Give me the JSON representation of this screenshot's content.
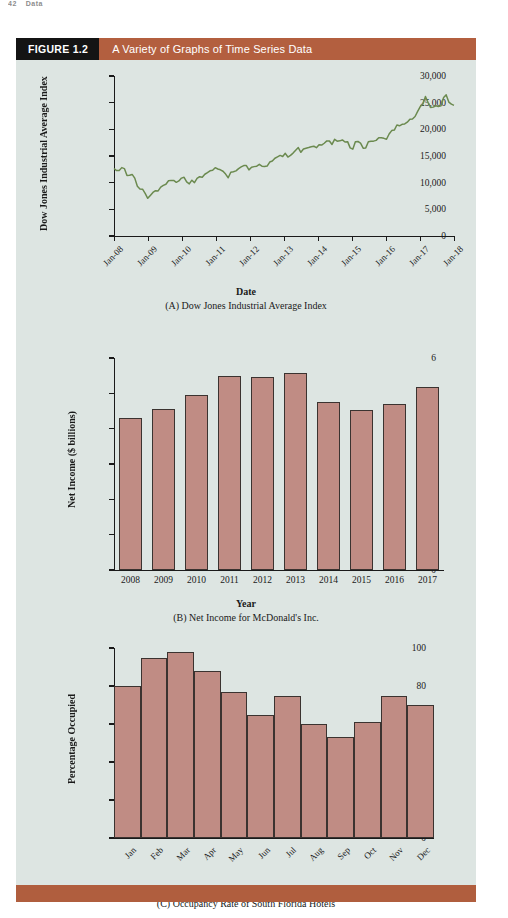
{
  "page_header": {
    "number": "42",
    "text": "Data"
  },
  "figure": {
    "tag": "FIGURE 1.2",
    "title": "A Variety of Graphs of Time Series Data",
    "accent_color": "#b35f3f",
    "tag_bg": "#141414",
    "panel_bg": "#dde5e2",
    "line_color": "#6b8a4f",
    "bar_fill": "#c08c84",
    "bar_stroke": "#3b3330"
  },
  "chart_data": [
    {
      "type": "line",
      "id": "dow-jones",
      "title": "(A) Dow Jones Industrial Average Index",
      "xlabel": "Date",
      "ylabel": "Dow Jones Industrial Average Index",
      "ylim": [
        0,
        30000
      ],
      "yticks": [
        0,
        5000,
        10000,
        15000,
        20000,
        25000,
        30000
      ],
      "ytick_labels": [
        "0",
        "5,000",
        "10,000",
        "15,000",
        "20,000",
        "25,000",
        "30,000"
      ],
      "xticks": [
        "Jan-08",
        "Jan-09",
        "Jan-10",
        "Jan-11",
        "Jan-12",
        "Jan-13",
        "Jan-14",
        "Jan-15",
        "Jan-16",
        "Jan-17",
        "Jan-18"
      ],
      "grid": false,
      "legend": "none",
      "series": [
        {
          "name": "Dow Jones Industrial Average Index",
          "color": "#6b8a4f",
          "values": [
            12650,
            12270,
            12260,
            12820,
            12640,
            11350,
            11378,
            11544,
            10850,
            9325,
            8829,
            8776,
            8000,
            7063,
            7609,
            8168,
            8500,
            8447,
            9172,
            9496,
            9712,
            10345,
            10428,
            10428,
            10067,
            10325,
            10857,
            11009,
            10137,
            9774,
            10466,
            10015,
            10788,
            11118,
            11006,
            11578,
            11892,
            12226,
            12320,
            12811,
            12570,
            12414,
            12143,
            11614,
            10913,
            11955,
            12046,
            12218,
            12633,
            12952,
            13212,
            13214,
            12393,
            12880,
            13009,
            13091,
            13437,
            13096,
            13026,
            13104,
            13861,
            14054,
            14579,
            14840,
            15116,
            14910,
            15500,
            14810,
            15130,
            15546,
            16086,
            16577,
            15699,
            16322,
            16458,
            16581,
            16717,
            16827,
            16563,
            17098,
            17043,
            17391,
            17828,
            17823,
            17165,
            18133,
            17776,
            17841,
            18011,
            17620,
            17690,
            16528,
            16285,
            17664,
            17720,
            17425,
            16466,
            16517,
            17685,
            17774,
            17787,
            17930,
            18432,
            18401,
            18308,
            18142,
            19124,
            19763,
            19864,
            20812,
            20663,
            20941,
            21009,
            21350,
            21891,
            21948,
            22405,
            23377,
            24272,
            24719,
            26149,
            25029,
            24103,
            24163,
            24416,
            24271,
            24413,
            25965,
            26458,
            25116,
            24719,
            24500
          ]
        }
      ]
    },
    {
      "type": "bar",
      "id": "mcdonalds-net-income",
      "title": "(B) Net Income for McDonald's Inc.",
      "xlabel": "Year",
      "ylabel": "Net Income ($ billions)",
      "ylim": [
        0,
        6
      ],
      "yticks": [
        0,
        1,
        2,
        3,
        4,
        5,
        6
      ],
      "ytick_labels": [
        "0",
        "1",
        "2",
        "3",
        "4",
        "5",
        "6"
      ],
      "categories": [
        "2008",
        "2009",
        "2010",
        "2011",
        "2012",
        "2013",
        "2014",
        "2015",
        "2016",
        "2017"
      ],
      "values": [
        4.31,
        4.55,
        4.95,
        5.5,
        5.46,
        5.59,
        4.76,
        4.53,
        4.69,
        5.19
      ],
      "grid": false,
      "legend": "none"
    },
    {
      "type": "bar",
      "id": "south-florida-hotel-occupancy",
      "title": "(C) Occupancy Rate of South Florida Hotels",
      "xlabel": "Month",
      "ylabel": "Percentage Occupied",
      "ylim": [
        0,
        100
      ],
      "yticks": [
        0,
        20,
        40,
        60,
        80,
        100
      ],
      "ytick_labels": [
        "0",
        "20",
        "40",
        "60",
        "80",
        "100"
      ],
      "categories": [
        "Jan",
        "Feb",
        "Mar",
        "Apr",
        "May",
        "Jun",
        "Jul",
        "Aug",
        "Sep",
        "Oct",
        "Nov",
        "Dec"
      ],
      "values": [
        80,
        95,
        98,
        88,
        77,
        65,
        75,
        60,
        53,
        61,
        75,
        70
      ],
      "grid": false,
      "legend": "none"
    }
  ]
}
